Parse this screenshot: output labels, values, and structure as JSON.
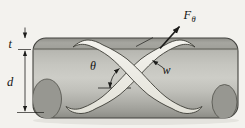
{
  "figure": {
    "labels": {
      "thickness": "t",
      "diameter": "d",
      "helix_angle": "θ",
      "strip_width": "w",
      "force_main": "F",
      "force_sub": "θ"
    },
    "colors": {
      "background": "#f3f2ee",
      "shadow": "#e4e3de",
      "body_top_dark": "#8f8f89",
      "band": "#a6a6a0",
      "band_low": "#a0a09a",
      "body_upper": "#b7b7b1",
      "body_bright": "#cdcdc7",
      "body_lower": "#aeaea8",
      "body_bottom": "#8b8b85",
      "endcap": "#979791",
      "strip": "#f4f3ee",
      "strip_shade": "#e3e2d9",
      "outline": "#3c3c36",
      "annotation": "#1c1c1a"
    }
  }
}
